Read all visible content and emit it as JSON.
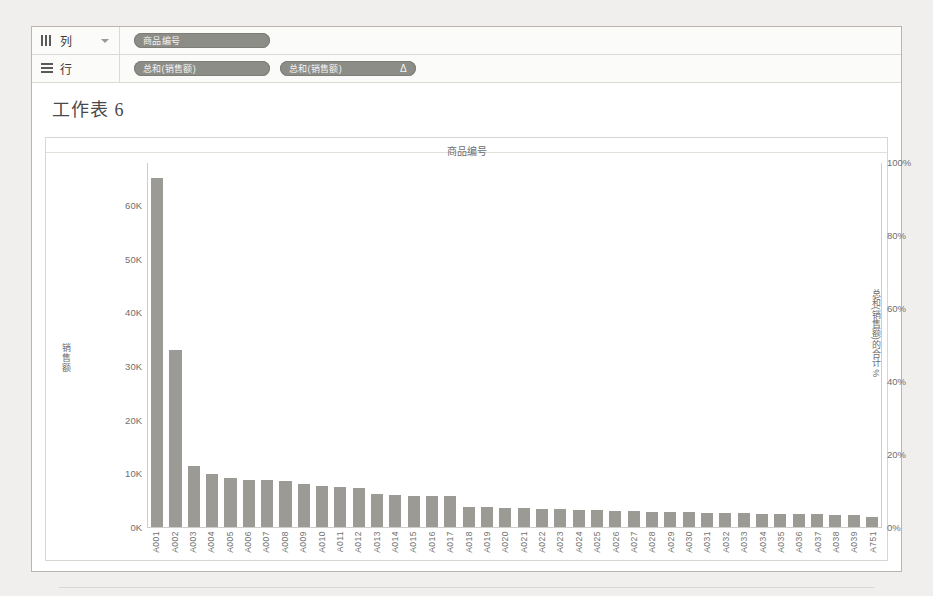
{
  "window": {
    "worksheet_title": "工作表 6"
  },
  "shelves": [
    {
      "name": "columns",
      "label": "列",
      "icon": "columns-icon",
      "has_caret": true,
      "pills": [
        {
          "label": "商品编号",
          "delta": ""
        }
      ]
    },
    {
      "name": "rows",
      "label": "行",
      "icon": "rows-icon",
      "has_caret": false,
      "pills": [
        {
          "label": "总和(销售额)",
          "delta": ""
        },
        {
          "label": "总和(销售额)",
          "delta": "Δ"
        }
      ]
    }
  ],
  "chart_data": {
    "type": "bar",
    "title": "商品编号",
    "xlabel": "",
    "ylabel": "销售额",
    "y2label": "总和(销售额)的合计 %",
    "ylim": [
      0,
      68000
    ],
    "y2lim": [
      0,
      100
    ],
    "grid": false,
    "legend": "none",
    "y_ticks": [
      "0K",
      "10K",
      "20K",
      "30K",
      "40K",
      "50K",
      "60K"
    ],
    "y_tick_values": [
      0,
      10000,
      20000,
      30000,
      40000,
      50000,
      60000
    ],
    "y2_ticks": [
      "0%",
      "20%",
      "40%",
      "60%",
      "80%",
      "100%"
    ],
    "y2_tick_values": [
      0,
      20,
      40,
      60,
      80,
      100
    ],
    "categories": [
      "A001",
      "A002",
      "A003",
      "A004",
      "A005",
      "A006",
      "A007",
      "A008",
      "A009",
      "A010",
      "A011",
      "A012",
      "A013",
      "A014",
      "A015",
      "A016",
      "A017",
      "A018",
      "A019",
      "A020",
      "A021",
      "A022",
      "A023",
      "A024",
      "A025",
      "A026",
      "A027",
      "A028",
      "A029",
      "A030",
      "A031",
      "A032",
      "A033",
      "A034",
      "A035",
      "A036",
      "A037",
      "A038",
      "A039",
      "A751"
    ],
    "series": [
      {
        "name": "总和(销售额)",
        "type": "bar",
        "axis": "left",
        "color": "#9b9a95",
        "values": [
          65200,
          33200,
          11600,
          10000,
          9400,
          9000,
          8900,
          8700,
          8200,
          7800,
          7700,
          7500,
          6400,
          6100,
          6000,
          5900,
          5900,
          4000,
          3900,
          3800,
          3700,
          3600,
          3500,
          3400,
          3300,
          3200,
          3100,
          3000,
          2950,
          2900,
          2850,
          2800,
          2750,
          2700,
          2650,
          2600,
          2550,
          2500,
          2450,
          2000
        ]
      },
      {
        "name": "总和(销售额)的合计 %",
        "type": "line",
        "axis": "right",
        "color": "#636363",
        "values": [
          23.0,
          34.7,
          38.8,
          42.3,
          45.6,
          48.8,
          51.9,
          55.0,
          57.9,
          60.6,
          63.3,
          65.9,
          68.2,
          70.4,
          72.5,
          74.5,
          76.6,
          78.0,
          79.4,
          80.7,
          82.0,
          83.3,
          84.5,
          85.7,
          86.9,
          88.0,
          89.1,
          90.2,
          91.2,
          92.3,
          93.3,
          94.3,
          95.2,
          96.2,
          97.1,
          98.0,
          98.9,
          99.8,
          100.0,
          100.0
        ]
      }
    ]
  }
}
